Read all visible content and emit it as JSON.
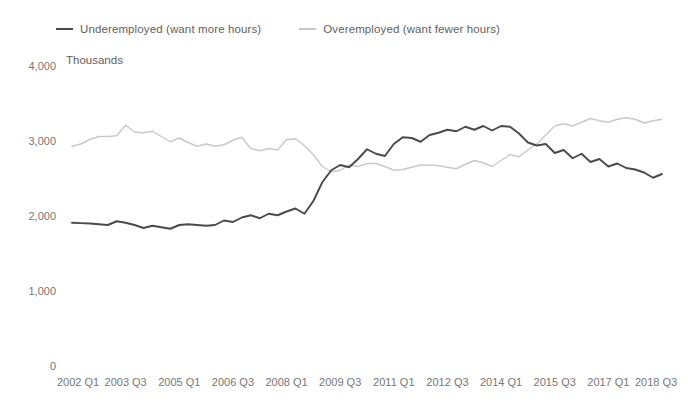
{
  "legend": {
    "items": [
      {
        "label": "Underemployed (want more hours)",
        "color": "#4a4a4a",
        "key": "underemployed"
      },
      {
        "label": "Overemployed (want fewer hours)",
        "color": "#c9c9c9",
        "key": "overemployed"
      }
    ]
  },
  "chart_data": {
    "type": "line",
    "title": "",
    "subtitle": "",
    "xlabel": "",
    "ylabel": "Thousands",
    "ylim": [
      0,
      4000
    ],
    "ytick_values": [
      0,
      1000,
      2000,
      3000,
      4000
    ],
    "ytick_labels": [
      "0",
      "1,000",
      "2,000",
      "3,000",
      "4,000"
    ],
    "grid": false,
    "legend_position": "top-left",
    "x": [
      "2002 Q1",
      "2002 Q2",
      "2002 Q3",
      "2002 Q4",
      "2003 Q1",
      "2003 Q2",
      "2003 Q3",
      "2003 Q4",
      "2004 Q1",
      "2004 Q2",
      "2004 Q3",
      "2004 Q4",
      "2005 Q1",
      "2005 Q2",
      "2005 Q3",
      "2005 Q4",
      "2006 Q1",
      "2006 Q2",
      "2006 Q3",
      "2006 Q4",
      "2007 Q1",
      "2007 Q2",
      "2007 Q3",
      "2007 Q4",
      "2008 Q1",
      "2008 Q2",
      "2008 Q3",
      "2008 Q4",
      "2009 Q1",
      "2009 Q2",
      "2009 Q3",
      "2009 Q4",
      "2010 Q1",
      "2010 Q2",
      "2010 Q3",
      "2010 Q4",
      "2011 Q1",
      "2011 Q2",
      "2011 Q3",
      "2011 Q4",
      "2012 Q1",
      "2012 Q2",
      "2012 Q3",
      "2012 Q4",
      "2013 Q1",
      "2013 Q2",
      "2013 Q3",
      "2013 Q4",
      "2014 Q1",
      "2014 Q2",
      "2014 Q3",
      "2014 Q4",
      "2015 Q1",
      "2015 Q2",
      "2015 Q3",
      "2015 Q4",
      "2016 Q1",
      "2016 Q2",
      "2016 Q3",
      "2016 Q4",
      "2017 Q1",
      "2017 Q2",
      "2017 Q3",
      "2017 Q4",
      "2018 Q1",
      "2018 Q2",
      "2018 Q3"
    ],
    "xtick_labels": [
      "2002 Q1",
      "2003 Q3",
      "2005 Q1",
      "2006 Q3",
      "2008 Q1",
      "2009 Q3",
      "2011 Q1",
      "2012 Q3",
      "2014 Q1",
      "2015 Q3",
      "2017 Q1",
      "2018 Q3"
    ],
    "xtick_indices": [
      0,
      6,
      12,
      18,
      24,
      30,
      36,
      42,
      48,
      54,
      60,
      66
    ],
    "series": [
      {
        "name": "Underemployed (want more hours)",
        "color": "#4a4a4a",
        "values": [
          1910,
          1905,
          1900,
          1890,
          1880,
          1930,
          1910,
          1880,
          1840,
          1870,
          1850,
          1830,
          1880,
          1890,
          1880,
          1870,
          1880,
          1940,
          1920,
          1980,
          2010,
          1970,
          2030,
          2010,
          2060,
          2100,
          2030,
          2200,
          2450,
          2610,
          2680,
          2650,
          2760,
          2890,
          2830,
          2800,
          2960,
          3050,
          3040,
          2990,
          3080,
          3110,
          3150,
          3130,
          3190,
          3150,
          3200,
          3140,
          3200,
          3190,
          3100,
          2980,
          2940,
          2960,
          2840,
          2880,
          2770,
          2830,
          2720,
          2760,
          2660,
          2700,
          2640,
          2620,
          2580,
          2510,
          2560
        ]
      },
      {
        "name": "Overemployed (want fewer hours)",
        "color": "#c9c9c9",
        "values": [
          2930,
          2960,
          3020,
          3060,
          3060,
          3070,
          3210,
          3120,
          3110,
          3130,
          3060,
          2990,
          3040,
          2980,
          2930,
          2960,
          2930,
          2950,
          3010,
          3050,
          2900,
          2870,
          2900,
          2880,
          3020,
          3030,
          2940,
          2820,
          2660,
          2590,
          2610,
          2680,
          2660,
          2700,
          2700,
          2660,
          2610,
          2620,
          2650,
          2680,
          2680,
          2670,
          2650,
          2630,
          2690,
          2740,
          2710,
          2660,
          2740,
          2820,
          2790,
          2880,
          2960,
          3080,
          3200,
          3230,
          3200,
          3250,
          3300,
          3270,
          3250,
          3290,
          3310,
          3290,
          3240,
          3270,
          3290
        ]
      }
    ]
  }
}
